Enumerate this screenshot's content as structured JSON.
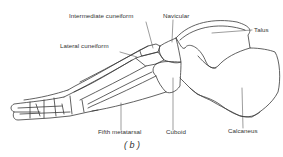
{
  "figure": {
    "caption": "( b )",
    "line_color": "#3a3a3a",
    "background": "#ffffff"
  },
  "labels": {
    "intermediate_cuneiform": "Intermediate cuneiform",
    "navicular": "Navicular",
    "talus": "Talus",
    "lateral_cuneiform": "Lateral cuneiform",
    "fifth_metatarsal": "Fifth metatarsal",
    "cuboid": "Cuboid",
    "calcaneus": "Calcaneus"
  }
}
